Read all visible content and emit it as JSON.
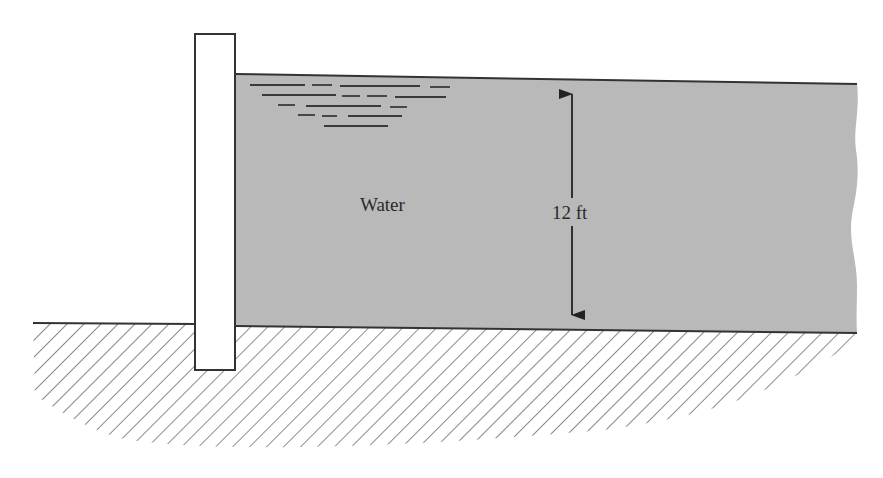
{
  "diagram": {
    "type": "hydrostatic retaining wall",
    "labels": {
      "fluid": "Water",
      "depth": "12 ft"
    },
    "colors": {
      "water_fill": "#b9b9b9",
      "outline": "#333333",
      "hatch": "#6e6e6e",
      "wall_fill": "#ffffff",
      "background": "#ffffff"
    },
    "elements": {
      "wall": "Vertical retaining wall embedded in ground",
      "water": "Water body held by the wall",
      "ground": "Hatched soil below",
      "dimension": "Double-headed arrow showing water depth"
    }
  }
}
